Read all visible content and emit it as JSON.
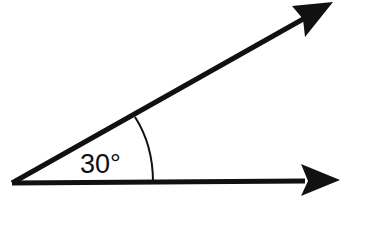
{
  "diagram": {
    "type": "angle",
    "angle_label": "30°",
    "angle_degrees": 30,
    "rays": [
      {
        "name": "top-ray",
        "has_arrow": true
      },
      {
        "name": "bottom-ray",
        "has_arrow": true
      }
    ],
    "colors": {
      "stroke": "#111111",
      "background": "#ffffff"
    }
  }
}
